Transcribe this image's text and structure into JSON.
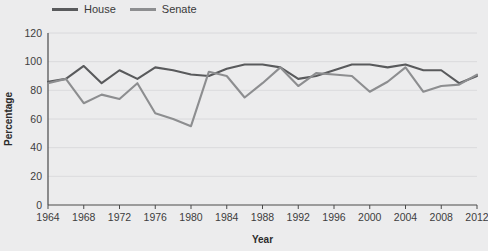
{
  "chart_data": {
    "type": "line",
    "title": "",
    "xlabel": "Year",
    "ylabel": "Percentage",
    "xlim": [
      1964,
      2012
    ],
    "ylim": [
      0,
      120
    ],
    "ygrid": true,
    "legend_position": "top-left",
    "x": [
      1964,
      1966,
      1968,
      1970,
      1972,
      1974,
      1976,
      1978,
      1980,
      1982,
      1984,
      1986,
      1988,
      1990,
      1992,
      1994,
      1996,
      1998,
      2000,
      2002,
      2004,
      2006,
      2008,
      2010,
      2012
    ],
    "xticks": [
      1964,
      1968,
      1972,
      1976,
      1980,
      1984,
      1988,
      1992,
      1996,
      2000,
      2004,
      2008,
      2012
    ],
    "yticks": [
      0,
      20,
      40,
      60,
      80,
      100,
      120
    ],
    "series": [
      {
        "name": "House",
        "color": "#595a5c",
        "values": [
          86,
          88,
          97,
          85,
          94,
          88,
          96,
          94,
          91,
          90,
          95,
          98,
          98,
          96,
          88,
          90,
          94,
          98,
          98,
          96,
          98,
          94,
          94,
          85,
          90
        ]
      },
      {
        "name": "Senate",
        "color": "#8d8e90",
        "values": [
          85,
          88,
          71,
          77,
          74,
          85,
          64,
          60,
          55,
          93,
          90,
          75,
          85,
          96,
          83,
          92,
          91,
          90,
          79,
          86,
          96,
          79,
          83,
          84,
          91
        ]
      }
    ]
  },
  "legend": {
    "entries": [
      {
        "label": "House",
        "color": "#595a5c"
      },
      {
        "label": "Senate",
        "color": "#8d8e90"
      }
    ]
  },
  "axes": {
    "x_title": "Year",
    "y_title": "Percentage"
  }
}
